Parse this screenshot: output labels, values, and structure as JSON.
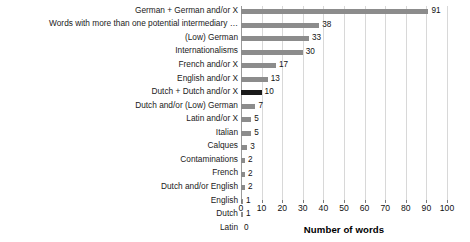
{
  "chart_data": {
    "type": "bar",
    "orientation": "horizontal",
    "title": "",
    "xlabel": "Number of words",
    "ylabel": "",
    "xlim": [
      0,
      100
    ],
    "xticks": [
      0,
      10,
      20,
      30,
      40,
      50,
      60,
      70,
      80,
      90,
      100
    ],
    "grid": true,
    "legend": false,
    "categories": [
      "German + German and/or X",
      "Words with more than one potential intermediary …",
      "(Low) German",
      "Internationalisms",
      "French and/or X",
      "English and/or X",
      "Dutch + Dutch and/or X",
      "Dutch and/or (Low) German",
      "Latin and/or X",
      "Italian",
      "Calques",
      "Contaminations",
      "French",
      "Dutch and/or English",
      "English",
      "Dutch",
      "Latin"
    ],
    "values": [
      91,
      38,
      33,
      30,
      17,
      13,
      10,
      7,
      5,
      5,
      3,
      2,
      2,
      2,
      1,
      1,
      0
    ],
    "value_labels": [
      "91",
      "38",
      "33",
      "30",
      "17",
      "13",
      "10",
      "7",
      "5",
      "5",
      "3",
      "2",
      "2",
      "2",
      "1",
      "1",
      "0"
    ],
    "bar_colors": [
      "#8c8c8c",
      "#8c8c8c",
      "#8c8c8c",
      "#8c8c8c",
      "#8c8c8c",
      "#8c8c8c",
      "#1a1a1a",
      "#8c8c8c",
      "#8c8c8c",
      "#8c8c8c",
      "#8c8c8c",
      "#8c8c8c",
      "#8c8c8c",
      "#8c8c8c",
      "#8c8c8c",
      "#8c8c8c",
      "#8c8c8c"
    ],
    "highlight_index": 6,
    "colors": {
      "bar_default": "#8c8c8c",
      "bar_highlight": "#1a1a1a",
      "gridline": "#d8d8d8",
      "axis": "#9a9a9a",
      "text": "#111111",
      "background": "#ffffff"
    }
  }
}
